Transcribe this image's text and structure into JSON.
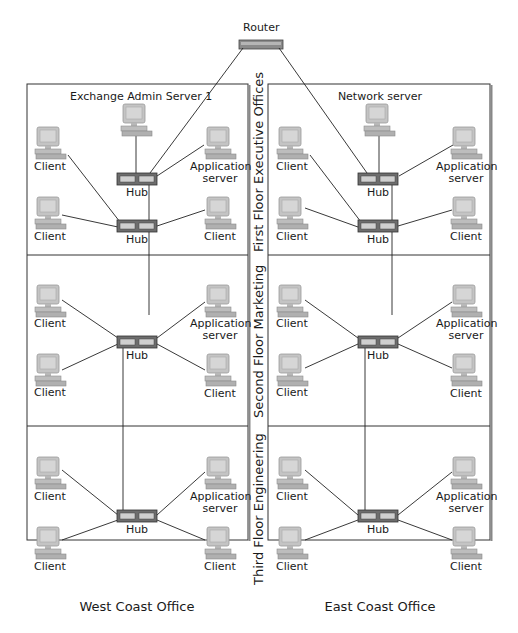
{
  "router": {
    "label": "Router"
  },
  "offices": [
    {
      "name": "West Coast Office",
      "top_server": "Exchange Admin Server 1"
    },
    {
      "name": "East Coast Office",
      "top_server": "Network server"
    }
  ],
  "floors": [
    {
      "name": "First Floor Executive Offices"
    },
    {
      "name": "Second Floor Marketing"
    },
    {
      "name": "Third Floor Engineering"
    }
  ],
  "labels": {
    "hub": "Hub",
    "client": "Client",
    "app_line1": "Application",
    "app_line2": "server"
  },
  "colors": {
    "line": "#222222",
    "monitor": "#c9c9c9",
    "hub_body": "#6f6f6f",
    "box_border": "#333333"
  }
}
